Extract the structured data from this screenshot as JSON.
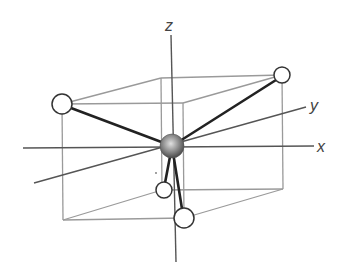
{
  "diagram": {
    "type": "molecular-geometry",
    "axes": {
      "x": {
        "label": "x"
      },
      "y": {
        "label": "y"
      },
      "z": {
        "label": "z"
      }
    },
    "colors": {
      "box_edge": "#9a9a9a",
      "axis": "#555555",
      "bond": "#222222",
      "atom_outline": "#333333",
      "ligand_fill": "#ffffff",
      "central_light": "#d8d8d8",
      "central_dark": "#5a5a5a"
    },
    "central_atom": {
      "name": "central-atom"
    },
    "ligands": [
      {
        "name": "ligand-upper-left"
      },
      {
        "name": "ligand-upper-right"
      },
      {
        "name": "ligand-lower-back"
      },
      {
        "name": "ligand-lower-front"
      }
    ]
  }
}
